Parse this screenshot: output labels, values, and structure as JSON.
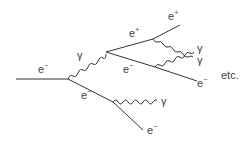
{
  "diagram": {
    "type": "electromagnetic-shower",
    "line_color": "#333333",
    "labels": {
      "incoming_electron": {
        "base": "e",
        "charge": "−"
      },
      "photon_1": "γ",
      "positron_1": {
        "base": "e",
        "charge": "+"
      },
      "electron_pair": {
        "base": "e",
        "charge": "−"
      },
      "electron_lower": {
        "base": "e",
        "charge": "−"
      },
      "positron_2": {
        "base": "e",
        "charge": "+"
      },
      "photon_2": "γ",
      "photon_3": "γ",
      "electron_out_right": {
        "base": "e",
        "charge": "−"
      },
      "photon_4": "γ",
      "electron_out_bottom": {
        "base": "e",
        "charge": "−"
      },
      "etc": "etc."
    }
  }
}
